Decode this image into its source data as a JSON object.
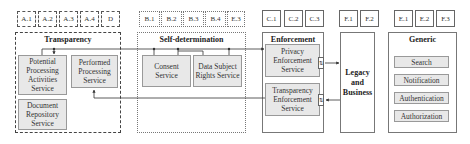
{
  "top_tags": {
    "transparency": [
      "A.1",
      "A.2",
      "A.3",
      "A.4",
      "D"
    ],
    "self_determination": [
      "B.1",
      "B.2",
      "B.3",
      "B.4",
      "E.3"
    ],
    "enforcement": [
      "C.1",
      "C.2",
      "C.3"
    ],
    "legacy": [
      "F.1",
      "F.2"
    ],
    "generic": [
      "E.1",
      "E.2",
      "F.3"
    ]
  },
  "groups": {
    "transparency": {
      "title": "Transparency",
      "services": {
        "potential": "Potential Processing Activities Service",
        "performed": "Performed Processing Service",
        "document": "Document Repository Service"
      }
    },
    "self_determination": {
      "title": "Self-determination",
      "services": {
        "consent": "Consent Service",
        "dsr": "Data Subject Rights Service"
      }
    },
    "enforcement": {
      "title": "Enforcement",
      "services": {
        "privacy": "Privacy Enforcement Service",
        "transparency": "Transparency Enforcement Service"
      },
      "port_glyph": "⇅"
    },
    "legacy": {
      "title": "Legacy and Business"
    },
    "generic": {
      "title": "Generic",
      "services": [
        "Search",
        "Notification",
        "Authentication",
        "Authorization"
      ]
    }
  },
  "colors": {
    "service_fill": "#e8e8e8",
    "line": "#333333"
  }
}
